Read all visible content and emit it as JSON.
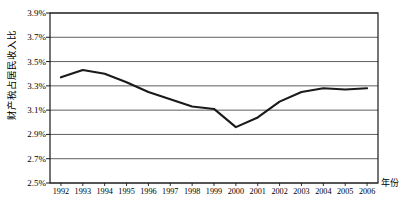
{
  "chart_data": {
    "type": "line",
    "title": "",
    "xlabel": "年份",
    "ylabel": "财产税占居民收入比",
    "categories": [
      "1992",
      "1993",
      "1994",
      "1995",
      "1996",
      "1997",
      "1998",
      "1999",
      "2000",
      "2001",
      "2002",
      "2003",
      "2004",
      "2005",
      "2006"
    ],
    "values": [
      3.37,
      3.43,
      3.4,
      3.33,
      3.25,
      3.19,
      3.13,
      3.11,
      2.96,
      3.04,
      3.17,
      3.25,
      3.28,
      3.27,
      3.28
    ],
    "value_unit": "%",
    "ylim": [
      2.5,
      3.9
    ],
    "ytick_values": [
      3.9,
      3.7,
      3.5,
      3.3,
      3.1,
      2.9,
      2.7,
      2.5
    ],
    "ytick_labels": [
      "3.9%",
      "3.7%",
      "3.5%",
      "3.3%",
      "3.1%",
      "2.9%",
      "2.7%",
      "2.5%"
    ],
    "grid": true,
    "grid_axis": "y",
    "legend": null,
    "legend_position": "none",
    "series": [
      {
        "name": "财产税占居民收入比",
        "values": [
          3.37,
          3.43,
          3.4,
          3.33,
          3.25,
          3.19,
          3.13,
          3.11,
          2.96,
          3.04,
          3.17,
          3.25,
          3.28,
          3.27,
          3.28
        ]
      }
    ],
    "colors": {
      "line": "#1a1a1a",
      "grid": "#4d4d4d",
      "axis": "#1a1a1a",
      "background": "#ffffff",
      "text": "#000000"
    }
  }
}
